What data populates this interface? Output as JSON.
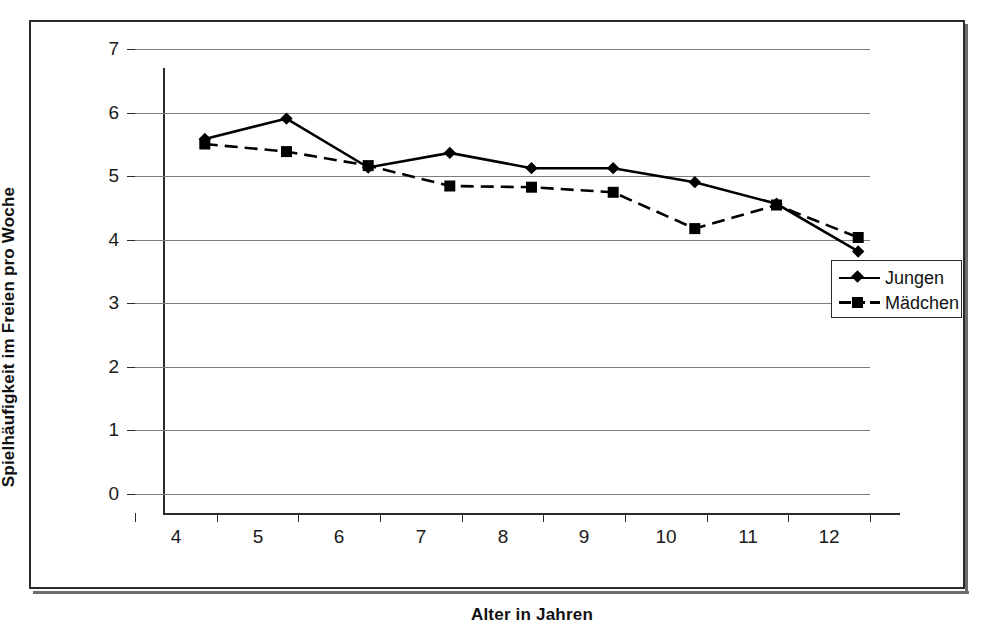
{
  "chart_data": {
    "type": "line",
    "title": "",
    "xlabel": "Alter in Jahren",
    "ylabel": "Spielhäufigkeit im Freien pro Woche",
    "categories": [
      "4",
      "5",
      "6",
      "7",
      "8",
      "9",
      "10",
      "11",
      "12"
    ],
    "xlim": [
      4,
      12
    ],
    "ylim": [
      0,
      7
    ],
    "ytick_labels": [
      "0",
      "1",
      "2",
      "3",
      "4",
      "5",
      "6",
      "7"
    ],
    "grid": true,
    "legend_position": "right-middle",
    "series": [
      {
        "name": "Jungen",
        "marker": "diamond",
        "linestyle": "solid",
        "color": "#000000",
        "values": [
          5.9,
          6.22,
          5.45,
          5.68,
          5.44,
          5.44,
          5.22,
          4.88,
          4.13
        ]
      },
      {
        "name": "Mädchen",
        "marker": "square",
        "linestyle": "dashed",
        "color": "#000000",
        "values": [
          5.82,
          5.7,
          5.48,
          5.16,
          5.14,
          5.06,
          4.49,
          4.86,
          4.35
        ]
      }
    ]
  },
  "legend": {
    "items": [
      {
        "label": "Jungen"
      },
      {
        "label": "Mädchen"
      }
    ]
  },
  "caption": {
    "text": ""
  }
}
